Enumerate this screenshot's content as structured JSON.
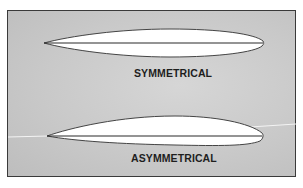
{
  "figure": {
    "colors": {
      "background": "#c9c9c9",
      "frame_border": "#3a3a3a",
      "airfoil_fill": "#ffffff",
      "airfoil_outline": "#444444",
      "text": "#1e1e1e"
    },
    "airfoils": [
      {
        "id": "symmetrical",
        "label": "SYMMETRICAL"
      },
      {
        "id": "asymmetrical",
        "label": "ASYMMETRICAL"
      }
    ]
  }
}
